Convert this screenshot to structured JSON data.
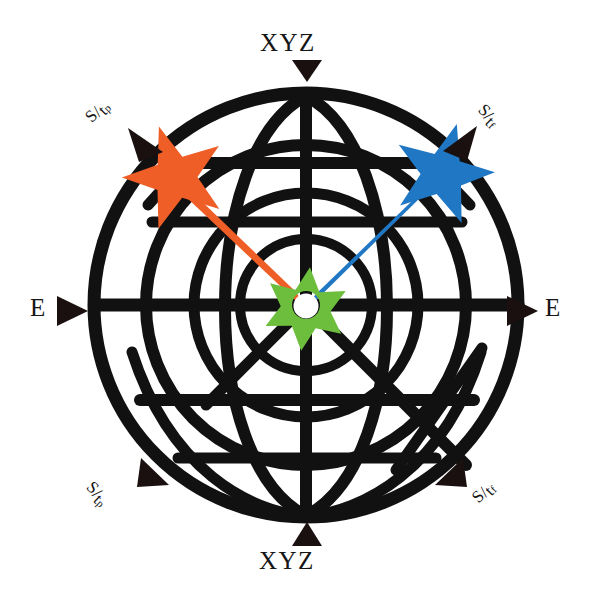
{
  "figure": {
    "background_color": "#ffffff",
    "line_color": "#111111"
  },
  "colors": {
    "orange_star": "#ee5e26",
    "blue_star": "#2077c4",
    "green_star": "#6dbe3d",
    "arrow_black": "#1a1010",
    "grid_black": "#111111",
    "hole_white": "#ffffff"
  },
  "labels": {
    "xyz_top": "XYZ",
    "xyz_bottom": "XYZ",
    "e_left": "E",
    "e_right": "E",
    "s_over_tp_top_left": {
      "numerator": "S",
      "slash": "/",
      "denominator": "t",
      "subscript": "p"
    },
    "s_over_tf_top_right": {
      "numerator": "S",
      "slash": "/",
      "denominator": "t",
      "subscript": "f"
    },
    "s_over_tp_bottom_left": {
      "numerator": "S",
      "slash": "/",
      "denominator": "t",
      "subscript": "p"
    },
    "s_over_tf_bottom_right": {
      "numerator": "S",
      "slash": "/",
      "denominator": "t",
      "subscript": "f"
    }
  },
  "markers": [
    {
      "name": "orange-star",
      "color": "#ee5e26",
      "points": 5,
      "center_px": [
        175,
        176
      ],
      "radius_px": 50,
      "direction": "upper-left",
      "has_hole": false
    },
    {
      "name": "blue-star",
      "color": "#2077c4",
      "points": 5,
      "center_px": [
        443,
        172
      ],
      "radius_px": 48,
      "direction": "upper-right",
      "has_hole": false
    },
    {
      "name": "green-star-center",
      "color": "#6dbe3d",
      "points": 6,
      "center_px": [
        306,
        305
      ],
      "radius_px": 38,
      "direction": "center",
      "has_hole": true,
      "hole_radius_px": 12
    }
  ],
  "rays": [
    {
      "name": "orange-ray",
      "color": "#ee5e26",
      "from_px": [
        306,
        305
      ],
      "to_px": [
        180,
        180
      ],
      "width_px": 20
    },
    {
      "name": "blue-ray",
      "color": "#2077c4",
      "from_px": [
        306,
        305
      ],
      "to_px": [
        438,
        178
      ],
      "width_px": 20
    }
  ],
  "arrows": [
    {
      "name": "arrow-xyz-top",
      "direction": "down",
      "tip_px": [
        307,
        78
      ]
    },
    {
      "name": "arrow-xyz-bottom",
      "direction": "up",
      "tip_px": [
        307,
        525
      ]
    },
    {
      "name": "arrow-e-left",
      "direction": "right",
      "tip_px": [
        85,
        311
      ]
    },
    {
      "name": "arrow-e-right",
      "direction": "right",
      "tip_px": [
        535,
        311
      ]
    },
    {
      "name": "arrow-stp-top-left",
      "direction": "up-left",
      "tip_px": [
        133,
        133
      ]
    },
    {
      "name": "arrow-stf-top-right",
      "direction": "up-right",
      "tip_px": [
        471,
        132
      ]
    },
    {
      "name": "arrow-stp-bottom-left",
      "direction": "up-left",
      "tip_px": [
        140,
        464
      ]
    },
    {
      "name": "arrow-stf-bottom-right",
      "direction": "up-left",
      "tip_px": [
        466,
        464
      ]
    }
  ],
  "globe": {
    "center_px": [
      306,
      305
    ],
    "outer_radius_px": 212,
    "concentric_radii_px": [
      212,
      160,
      112,
      66
    ],
    "has_vertical_meridian": true,
    "horizontal_latitudes_y_px": [
      163,
      222,
      305,
      395,
      455
    ],
    "diagonal_lines": 2
  }
}
